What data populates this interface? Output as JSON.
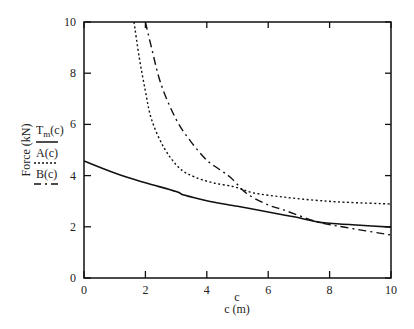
{
  "chart_data": {
    "type": "line",
    "title": "",
    "xlabel": "c (m)",
    "xlabel_var": "c",
    "ylabel": "Force (kN)",
    "xlim": [
      0,
      10
    ],
    "ylim": [
      0,
      10
    ],
    "x_ticks": [
      0,
      2,
      4,
      6,
      8,
      10
    ],
    "y_ticks": [
      0,
      2,
      4,
      6,
      8,
      10
    ],
    "grid": false,
    "legend_position": "left (beside y-axis label)",
    "series": [
      {
        "name": "T_m(c)",
        "label_main": "T",
        "label_sub": "m",
        "label_rest": "(c)",
        "style": "solid",
        "color": "#111111",
        "x": [
          0,
          1,
          2,
          3,
          3.26,
          4,
          5,
          6,
          6.5,
          7,
          7.6,
          8,
          9,
          10
        ],
        "y": [
          4.57,
          4.1,
          3.72,
          3.38,
          3.24,
          3.02,
          2.8,
          2.58,
          2.46,
          2.35,
          2.19,
          2.14,
          2.06,
          1.99
        ]
      },
      {
        "name": "A(c)",
        "style": "dotted",
        "color": "#111111",
        "x": [
          1.63,
          1.8,
          2.0,
          2.2,
          2.6,
          3.1,
          3.6,
          4.2,
          4.9,
          5.5,
          6.5,
          7.5,
          8.5,
          10
        ],
        "y": [
          10,
          8.6,
          7.3,
          6.2,
          5.1,
          4.3,
          3.95,
          3.72,
          3.56,
          3.33,
          3.16,
          3.04,
          2.96,
          2.89
        ]
      },
      {
        "name": "B(c)",
        "style": "dash-dot",
        "color": "#111111",
        "x": [
          2.0,
          2.2,
          2.5,
          3.0,
          3.5,
          4.0,
          4.4,
          4.8,
          5.3,
          6.0,
          6.5,
          7.6,
          8.5,
          10
        ],
        "y": [
          10,
          9.0,
          7.6,
          6.2,
          5.3,
          4.6,
          4.25,
          3.9,
          3.3,
          2.85,
          2.66,
          2.19,
          1.98,
          1.68
        ]
      }
    ]
  }
}
